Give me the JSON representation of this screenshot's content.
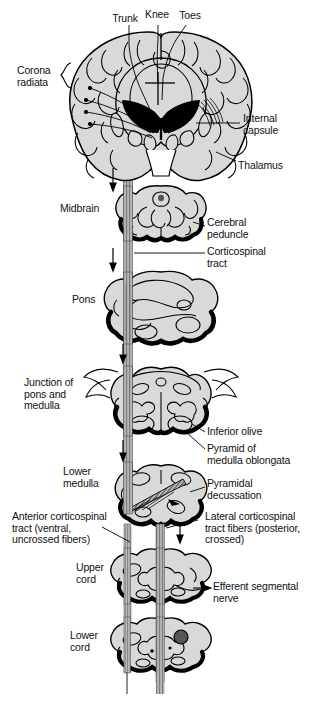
{
  "figure": {
    "type": "anatomical-diagram",
    "background_color": "#ffffff",
    "ink_color": "#000000",
    "tissue_fill": "#d9d9d9",
    "tract_fill": "#a8a8a8"
  },
  "labels": {
    "trunk": "Trunk",
    "knee": "Knee",
    "toes": "Toes",
    "corona_radiata": "Corona\nradiata",
    "internal_capsule": "Internal\ncapsule",
    "thalamus": "Thalamus",
    "midbrain": "Midbrain",
    "cerebral_peduncle": "Cerebral\npeduncle",
    "corticospinal_tract": "Corticospinal\ntract",
    "pons": "Pons",
    "junction_pons_medulla": "Junction of\npons and\nmedulla",
    "inferior_olive": "Inferior olive",
    "pyramid_medulla": "Pyramid of\nmedulla oblongata",
    "lower_medulla": "Lower\nmedulla",
    "pyramidal_decussation": "Pyramidal\ndecussation",
    "anterior_corticospinal": "Anterior corticospinal\ntract (ventral,\nuncrossed fibers)",
    "lateral_corticospinal": "Lateral corticospinal\ntract fibers (posterior,\ncrossed)",
    "upper_cord": "Upper\ncord",
    "efferent_segmental_nerve": "Efferent segmental\nnerve",
    "lower_cord": "Lower\ncord"
  },
  "sections": [
    {
      "name": "cerebral-hemispheres-coronal",
      "label": "Cerebrum (coronal section)"
    },
    {
      "name": "midbrain-cross-section",
      "label": "Midbrain"
    },
    {
      "name": "pons-cross-section",
      "label": "Pons"
    },
    {
      "name": "pons-medulla-junction-cross-section",
      "label": "Junction of pons and medulla"
    },
    {
      "name": "lower-medulla-cross-section",
      "label": "Lower medulla"
    },
    {
      "name": "upper-spinal-cord-cross-section",
      "label": "Upper cord"
    },
    {
      "name": "lower-spinal-cord-cross-section",
      "label": "Lower cord"
    }
  ]
}
